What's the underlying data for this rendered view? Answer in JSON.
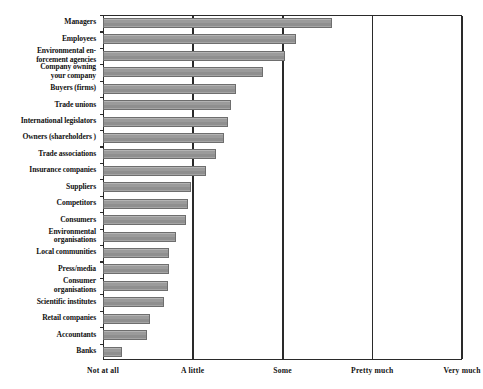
{
  "chart_data": {
    "type": "bar",
    "orientation": "horizontal",
    "title": "",
    "subtitle": "",
    "xlabel": "",
    "ylabel": "",
    "grid": true,
    "gridlines_at": [
      "Not at all",
      "A little",
      "Some",
      "Pretty much",
      "Very much"
    ],
    "legend": null,
    "legend_position": "none",
    "xlim": [
      0,
      4
    ],
    "xticks": [
      0,
      1,
      2,
      3,
      4
    ],
    "xticklabels": [
      "Not at all",
      "A little",
      "Some",
      "Pretty much",
      "Very much"
    ],
    "categories": [
      "Managers",
      "Employees",
      "Environmental en-forcement agencies",
      "Company owning your company",
      "Buyers (firms)",
      "Trade unions",
      "International legislators",
      "Owners (shareholders )",
      "Trade associations",
      "Insurance companies",
      "Suppliers",
      "Competitors",
      "Consumers",
      "Environmental organisations",
      "Local communities",
      "Press/media",
      "Consumer organisations",
      "Scientific institutes",
      "Retail companies",
      "Accountants",
      "Banks"
    ],
    "values": [
      2.55,
      2.15,
      2.03,
      1.78,
      1.48,
      1.43,
      1.39,
      1.35,
      1.26,
      1.15,
      0.98,
      0.95,
      0.92,
      0.81,
      0.74,
      0.73,
      0.72,
      0.68,
      0.52,
      0.49,
      0.21
    ]
  },
  "ylabels": [
    "Managers",
    "Employees",
    "Environmental en-|forcement agencies",
    "Company owning|your company",
    "Buyers (firms)",
    "Trade unions",
    "International legislators",
    "Owners (shareholders )",
    "Trade associations",
    "Insurance companies",
    "Suppliers",
    "Competitors",
    "Consumers",
    "Environmental|organisations",
    "Local communities",
    "Press/media",
    "Consumer|organisations",
    "Scientific institutes",
    "Retail companies",
    "Accountants",
    "Banks"
  ],
  "colors": {
    "bar_fill": "#9b9b9b",
    "bar_stroke": "#6e6e6e",
    "axis": "#2a2a2a",
    "text": "#111111",
    "background": "#ffffff"
  }
}
